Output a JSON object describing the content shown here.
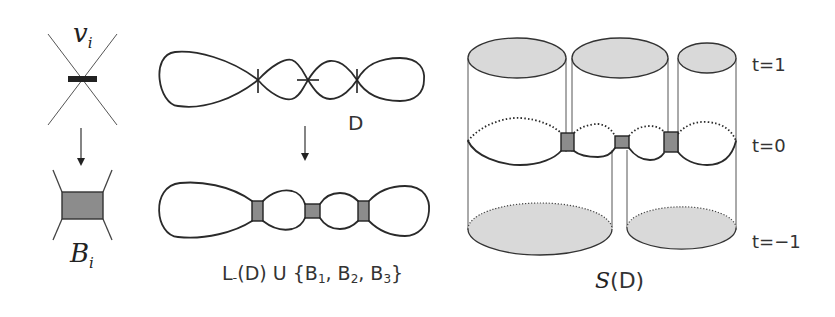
{
  "figure": {
    "left_panel": {
      "top_label": "v",
      "top_label_sub": "i",
      "bottom_label": "B",
      "bottom_label_sub": "i",
      "arrow": "down-arrow"
    },
    "middle_panel": {
      "diagram_label": "D",
      "caption_prefix": "L",
      "caption_minus": "-",
      "caption_rest": "(D) U {B",
      "caption_b1_sub": "1",
      "caption_sep1": ", B",
      "caption_b2_sub": "2",
      "caption_sep2": ", B",
      "caption_b3_sub": "3",
      "caption_close": "}",
      "crossings": 3,
      "bands": [
        "B1",
        "B2",
        "B3"
      ]
    },
    "right_panel": {
      "levels": [
        {
          "label": "t=1"
        },
        {
          "label": "t=0"
        },
        {
          "label": "t=−1"
        }
      ],
      "caption_script": "S",
      "caption_rest": "(D)"
    },
    "colors": {
      "line": "#2a2a2a",
      "band_fill": "#8c8c8c",
      "disk_fill": "#d9d9d9",
      "background": "#ffffff"
    }
  }
}
